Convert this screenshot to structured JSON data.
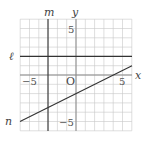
{
  "diagram": {
    "type": "coordinate-plane",
    "x_range": [
      -6,
      6
    ],
    "y_range": [
      -6,
      6
    ],
    "origin_label": "O",
    "x_axis_label": "x",
    "y_axis_label": "y",
    "tick_labels": {
      "x_neg": "−5",
      "x_pos": "5",
      "y_pos": "5",
      "y_neg": "−5"
    },
    "lines": [
      {
        "name": "ℓ",
        "equation": "y = 2",
        "from": [
          -6,
          2
        ],
        "to": [
          6,
          2
        ]
      },
      {
        "name": "m",
        "equation": "x = -3",
        "from": [
          -3,
          -6
        ],
        "to": [
          -3,
          6
        ]
      },
      {
        "name": "n",
        "equation": "y = 0.5x - 2",
        "from": [
          -6,
          -5
        ],
        "to": [
          6,
          1
        ]
      }
    ],
    "colors": {
      "grid": "#c8c8c8",
      "axes": "#8a8a8a",
      "lines": "#333333"
    }
  }
}
